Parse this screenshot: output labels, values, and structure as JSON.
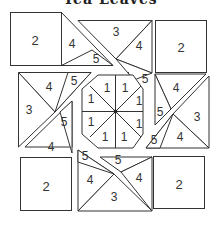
{
  "title": "Tea Leaves",
  "diagram": {
    "type": "quilt-block-piecing-diagram",
    "colors": {
      "line": "#333333",
      "background": "#ffffff",
      "text": "#333333"
    },
    "pieces": [
      {
        "id": "tl-square",
        "label": "2"
      },
      {
        "id": "tl-tri-4",
        "label": "4"
      },
      {
        "id": "tl-tri-5",
        "label": "5"
      },
      {
        "id": "tc-tri-3",
        "label": "3"
      },
      {
        "id": "tc-tri-4",
        "label": "4"
      },
      {
        "id": "tc-tri-5",
        "label": "5"
      },
      {
        "id": "tr-square",
        "label": "2"
      },
      {
        "id": "ml-tri-4",
        "label": "4"
      },
      {
        "id": "ml-tri-5a",
        "label": "5"
      },
      {
        "id": "ml-tri-3",
        "label": "3"
      },
      {
        "id": "ml-tri-5b",
        "label": "5"
      },
      {
        "id": "ml-tri-4b",
        "label": "4"
      },
      {
        "id": "oct-1a",
        "label": "1"
      },
      {
        "id": "oct-1b",
        "label": "1"
      },
      {
        "id": "oct-1c",
        "label": "1"
      },
      {
        "id": "oct-1d",
        "label": "1"
      },
      {
        "id": "oct-1e",
        "label": "1"
      },
      {
        "id": "oct-1f",
        "label": "1"
      },
      {
        "id": "oct-1g",
        "label": "1"
      },
      {
        "id": "oct-1h",
        "label": "1"
      },
      {
        "id": "mr-tri-4",
        "label": "4"
      },
      {
        "id": "mr-tri-5a",
        "label": "5"
      },
      {
        "id": "mr-tri-3",
        "label": "3"
      },
      {
        "id": "mr-tri-5b",
        "label": "5"
      },
      {
        "id": "mr-tri-4b",
        "label": "4"
      },
      {
        "id": "bl-square",
        "label": "2"
      },
      {
        "id": "bc-tri-5a",
        "label": "5"
      },
      {
        "id": "bc-tri-4a",
        "label": "4"
      },
      {
        "id": "bc-tri-3",
        "label": "3"
      },
      {
        "id": "bc-tri-5b",
        "label": "5"
      },
      {
        "id": "bc-tri-4b",
        "label": "4"
      },
      {
        "id": "br-square",
        "label": "2"
      }
    ]
  }
}
